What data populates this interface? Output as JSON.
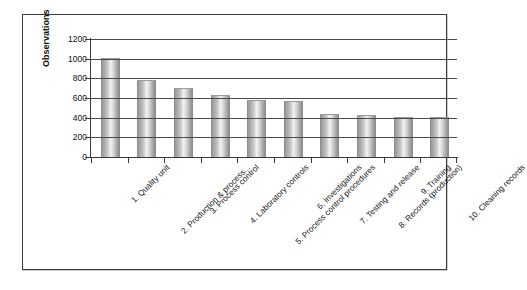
{
  "chart_data": {
    "type": "bar",
    "title": "",
    "xlabel": "",
    "ylabel": "Observations",
    "ylim": [
      0,
      1200
    ],
    "yticks": [
      0,
      200,
      400,
      600,
      800,
      1000,
      1200
    ],
    "ytick_labels": [
      "0",
      "200",
      "400",
      "600",
      "800",
      "1000",
      "1200"
    ],
    "grid": true,
    "legend": "none",
    "categories": [
      "1. Quality unit",
      "2. Production & process...",
      "3. Process control",
      "4. Laboratory controls",
      "5. Process control procedures",
      "6. Investigations",
      "7. Testing and release",
      "8. Records (production)",
      "9. Training",
      "10. Cleaning records"
    ],
    "values": [
      1000,
      770,
      690,
      620,
      570,
      560,
      430,
      420,
      400,
      400
    ],
    "bar_color": "#c4c4c4",
    "bar_edge_color": "#8d8d8d",
    "grid_color": "#4a4a4a",
    "axis_color": "#3a3a3a",
    "frame_color": "#3b3b3b",
    "background_color": "#ffffff"
  }
}
